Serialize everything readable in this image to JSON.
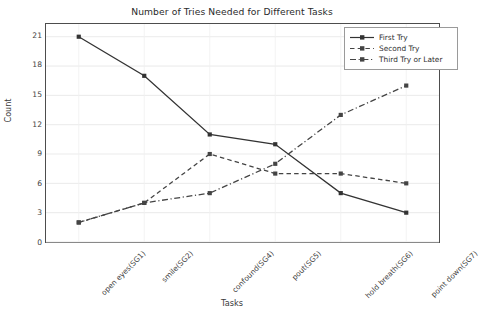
{
  "chart_data": {
    "type": "line",
    "title": "Number of Tries Needed for Different Tasks",
    "xlabel": "Tasks",
    "ylabel": "Count",
    "categories": [
      "open eyes(SG1)",
      "smile(SG2)",
      "confound(SG4)",
      "pout(SG5)",
      "hold breath(SG6)",
      "point down(SG7)"
    ],
    "series": [
      {
        "name": "First Try",
        "values": [
          21,
          17,
          11,
          10,
          5,
          3
        ],
        "linestyle": "solid",
        "color": "#333333",
        "marker": "square"
      },
      {
        "name": "Second Try",
        "values": [
          2,
          4,
          9,
          7,
          7,
          6
        ],
        "linestyle": "dashed",
        "color": "#444444",
        "marker": "square"
      },
      {
        "name": "Third Try or Later",
        "values": [
          2,
          4,
          5,
          8,
          13,
          16
        ],
        "linestyle": "dashdot",
        "color": "#444444",
        "marker": "square"
      }
    ],
    "yticks": [
      0,
      3,
      6,
      9,
      12,
      15,
      18,
      21
    ],
    "ylim": [
      0,
      22.3
    ],
    "grid": true,
    "legend_position": "upper right"
  },
  "legend": {
    "entries": [
      {
        "label": "First Try"
      },
      {
        "label": "Second Try"
      },
      {
        "label": "Third Try or Later"
      }
    ]
  }
}
